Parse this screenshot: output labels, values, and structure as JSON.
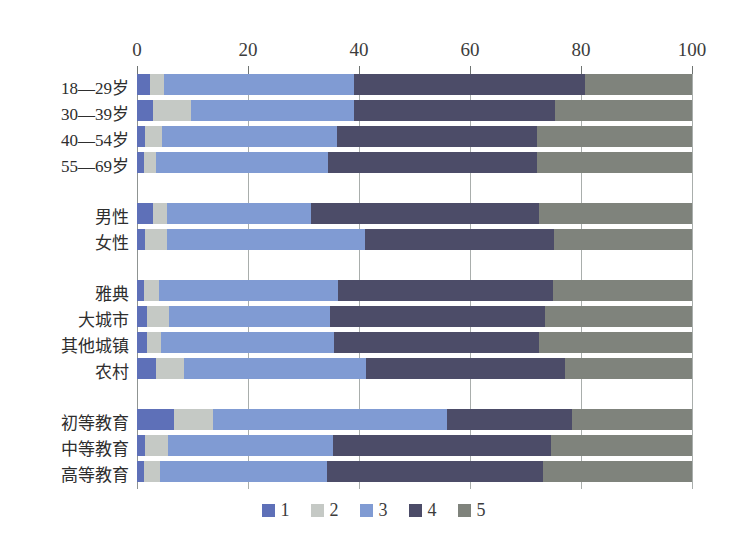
{
  "chart_data": {
    "type": "bar",
    "orientation": "horizontal",
    "stacked": true,
    "title": "",
    "xlabel": "",
    "ylabel": "",
    "x_axis": {
      "min": 0,
      "max": 100,
      "ticks": [
        0,
        20,
        40,
        60,
        80,
        100
      ],
      "position": "top",
      "grid": true
    },
    "legend": {
      "position": "bottom",
      "entries": [
        {
          "label": "1",
          "color": "#5e70b8"
        },
        {
          "label": "2",
          "color": "#c5c9c5"
        },
        {
          "label": "3",
          "color": "#809bd3"
        },
        {
          "label": "4",
          "color": "#4c4c68"
        },
        {
          "label": "5",
          "color": "#7f837c"
        }
      ]
    },
    "groups": [
      {
        "name": "age",
        "rows": [
          {
            "label": "18—29岁",
            "values": [
              2.3,
              2.6,
              34.2,
              41.6,
              19.3
            ]
          },
          {
            "label": "30—39岁",
            "values": [
              2.9,
              6.8,
              29.4,
              36.2,
              24.7
            ]
          },
          {
            "label": "40—54岁",
            "values": [
              1.5,
              3.0,
              31.5,
              36.0,
              28.0
            ]
          },
          {
            "label": "55—69岁",
            "values": [
              1.3,
              2.1,
              31.0,
              37.6,
              28.0
            ]
          }
        ]
      },
      {
        "name": "gender",
        "rows": [
          {
            "label": "男性",
            "values": [
              2.9,
              2.5,
              26.0,
              41.1,
              27.5
            ]
          },
          {
            "label": "女性",
            "values": [
              1.4,
              4.0,
              35.6,
              34.2,
              24.8
            ]
          }
        ]
      },
      {
        "name": "region",
        "rows": [
          {
            "label": "雅典",
            "values": [
              1.3,
              2.7,
              32.3,
              38.6,
              25.1
            ]
          },
          {
            "label": "大城市",
            "values": [
              1.8,
              3.9,
              29.1,
              38.8,
              26.4
            ]
          },
          {
            "label": "其他城镇",
            "values": [
              1.8,
              2.5,
              31.2,
              36.9,
              27.6
            ]
          },
          {
            "label": "农村",
            "values": [
              3.4,
              5.0,
              32.9,
              35.9,
              22.8
            ]
          }
        ]
      },
      {
        "name": "education",
        "rows": [
          {
            "label": "初等教育",
            "values": [
              6.6,
              7.1,
              42.2,
              22.5,
              21.6
            ]
          },
          {
            "label": "中等教育",
            "values": [
              1.5,
              4.0,
              29.8,
              39.3,
              25.4
            ]
          },
          {
            "label": "高等教育",
            "values": [
              1.2,
              2.9,
              30.2,
              38.9,
              26.8
            ]
          }
        ]
      }
    ]
  },
  "style_colors": {
    "grid": "#a9aeac",
    "tick": "#6f7472",
    "axis_text": "#3c3c3c",
    "label_text": "#2e2e2e",
    "background": "#ffffff"
  }
}
